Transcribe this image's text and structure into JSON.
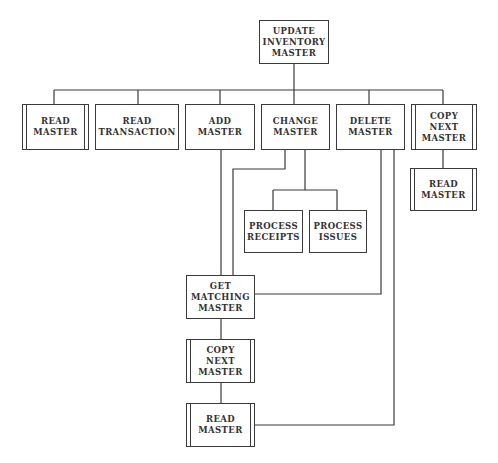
{
  "diagram": {
    "type": "structure chart",
    "root": {
      "id": "update",
      "label": "UPDATE\nINVENTORY\nMASTER"
    },
    "nodes": [
      {
        "id": "update",
        "label": "UPDATE\nINVENTORY\nMASTER",
        "predefined": false
      },
      {
        "id": "read_master_1",
        "label": "READ\nMASTER",
        "predefined": true
      },
      {
        "id": "read_transaction",
        "label": "READ\nTRANSACTION",
        "predefined": false
      },
      {
        "id": "add_master",
        "label": "ADD\nMASTER",
        "predefined": false
      },
      {
        "id": "change_master",
        "label": "CHANGE\nMASTER",
        "predefined": false
      },
      {
        "id": "delete_master",
        "label": "DELETE\nMASTER",
        "predefined": false
      },
      {
        "id": "copy_next_master_1",
        "label": "COPY\nNEXT\nMASTER",
        "predefined": true
      },
      {
        "id": "read_master_2",
        "label": "READ\nMASTER",
        "predefined": true
      },
      {
        "id": "process_receipts",
        "label": "PROCESS\nRECEIPTS",
        "predefined": false
      },
      {
        "id": "process_issues",
        "label": "PROCESS\nISSUES",
        "predefined": false
      },
      {
        "id": "get_matching_master",
        "label": "GET\nMATCHING\nMASTER",
        "predefined": false
      },
      {
        "id": "copy_next_master_2",
        "label": "COPY\nNEXT\nMASTER",
        "predefined": true
      },
      {
        "id": "read_master_3",
        "label": "READ\nMASTER",
        "predefined": true
      }
    ],
    "edges": [
      {
        "from": "update",
        "to": "read_master_1"
      },
      {
        "from": "update",
        "to": "read_transaction"
      },
      {
        "from": "update",
        "to": "add_master"
      },
      {
        "from": "update",
        "to": "change_master"
      },
      {
        "from": "update",
        "to": "delete_master"
      },
      {
        "from": "update",
        "to": "copy_next_master_1"
      },
      {
        "from": "copy_next_master_1",
        "to": "read_master_2"
      },
      {
        "from": "change_master",
        "to": "process_receipts"
      },
      {
        "from": "change_master",
        "to": "process_issues"
      },
      {
        "from": "add_master",
        "to": "get_matching_master"
      },
      {
        "from": "change_master",
        "to": "get_matching_master"
      },
      {
        "from": "delete_master",
        "to": "get_matching_master"
      },
      {
        "from": "get_matching_master",
        "to": "copy_next_master_2"
      },
      {
        "from": "copy_next_master_2",
        "to": "read_master_3"
      },
      {
        "from": "delete_master",
        "to": "read_master_3"
      }
    ]
  }
}
